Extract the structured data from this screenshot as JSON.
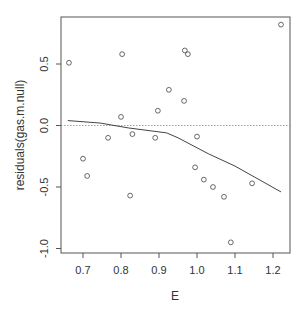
{
  "chart_data": {
    "type": "scatter",
    "title": "",
    "xlabel": "E",
    "ylabel": "residuals(gas.m.null)",
    "xlim": [
      0.64,
      1.24
    ],
    "ylim": [
      -1.0,
      0.85
    ],
    "x_ticks": [
      0.7,
      0.8,
      0.9,
      1.0,
      1.1,
      1.2
    ],
    "x_tick_labels": [
      "0.7",
      "0.8",
      "0.9",
      "1.0",
      "1.1",
      "1.2"
    ],
    "y_ticks": [
      -1.0,
      -0.5,
      0.0,
      0.5
    ],
    "y_tick_labels": [
      "-1.0",
      "-0.5",
      "0.0",
      "0.5"
    ],
    "grid": false,
    "reference_line": {
      "y": 0.0,
      "style": "dotted"
    },
    "series": [
      {
        "name": "residuals",
        "type": "scatter",
        "marker": "open-circle",
        "points": [
          {
            "x": 0.663,
            "y": 0.51
          },
          {
            "x": 0.7,
            "y": -0.27
          },
          {
            "x": 0.711,
            "y": -0.41
          },
          {
            "x": 0.766,
            "y": -0.1
          },
          {
            "x": 0.8,
            "y": 0.07
          },
          {
            "x": 0.803,
            "y": 0.58
          },
          {
            "x": 0.824,
            "y": -0.57
          },
          {
            "x": 0.83,
            "y": -0.07
          },
          {
            "x": 0.89,
            "y": -0.1
          },
          {
            "x": 0.897,
            "y": 0.12
          },
          {
            "x": 0.926,
            "y": 0.29
          },
          {
            "x": 0.966,
            "y": 0.2
          },
          {
            "x": 0.968,
            "y": 0.61
          },
          {
            "x": 0.976,
            "y": 0.58
          },
          {
            "x": 0.995,
            "y": -0.34
          },
          {
            "x": 1.0,
            "y": -0.09
          },
          {
            "x": 1.018,
            "y": -0.44
          },
          {
            "x": 1.042,
            "y": -0.5
          },
          {
            "x": 1.071,
            "y": -0.58
          },
          {
            "x": 1.089,
            "y": -0.95
          },
          {
            "x": 1.145,
            "y": -0.47
          },
          {
            "x": 1.221,
            "y": 0.82
          }
        ]
      },
      {
        "name": "smooth",
        "type": "line",
        "points": [
          {
            "x": 0.66,
            "y": 0.04
          },
          {
            "x": 0.745,
            "y": 0.02
          },
          {
            "x": 0.82,
            "y": -0.02
          },
          {
            "x": 0.92,
            "y": -0.06
          },
          {
            "x": 0.95,
            "y": -0.1
          },
          {
            "x": 1.03,
            "y": -0.23
          },
          {
            "x": 1.1,
            "y": -0.33
          },
          {
            "x": 1.221,
            "y": -0.54
          }
        ]
      }
    ]
  }
}
